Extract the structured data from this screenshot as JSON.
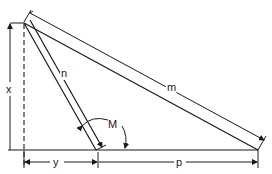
{
  "diagram": {
    "labels": {
      "x": "x",
      "y": "y",
      "n": "n",
      "m": "m",
      "p": "p",
      "M": "M"
    },
    "colors": {
      "line": "#1a1a1a",
      "background": "#ffffff"
    }
  }
}
